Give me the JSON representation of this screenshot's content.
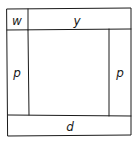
{
  "diagram": {
    "type": "hand-drawn frame layout",
    "line_color": "#1a1a1a",
    "background": "#ffffff",
    "regions": {
      "top_left": {
        "label": "w"
      },
      "top": {
        "label": "y"
      },
      "left": {
        "label": "p"
      },
      "right": {
        "label": "p"
      },
      "bottom": {
        "label": "d"
      },
      "center": {
        "label": ""
      }
    }
  }
}
